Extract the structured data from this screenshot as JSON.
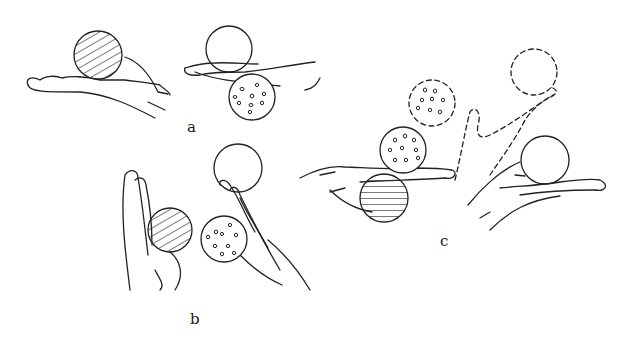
{
  "figure": {
    "panels": [
      {
        "id": "a",
        "label": "a",
        "description": "hands holding hatched ball on top of palm; plain ball on top and dotted ball under hand"
      },
      {
        "id": "b",
        "label": "b",
        "description": "vertical hands gripping hatched ball and dotted ball with plain ball above fingertips"
      },
      {
        "id": "c",
        "label": "c",
        "description": "ball transfer sequence: dotted ball on hand, hatched ball below, dashed trajectory and dashed ghost balls, final hand holding plain ball"
      }
    ],
    "colors": {
      "ink": "#222222",
      "background": "#ffffff"
    }
  }
}
